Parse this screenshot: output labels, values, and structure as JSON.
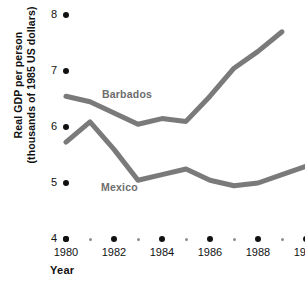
{
  "axes": {
    "ylabel": "Real GDP per person\n(thousands of 1985 US dollars)",
    "xlabel": "Year",
    "ytick_labels": [
      "8",
      "7",
      "6",
      "5",
      "4"
    ],
    "xtick_labels": [
      "1980",
      "1982",
      "1984",
      "1986",
      "1988",
      "1990"
    ]
  },
  "series_labels": {
    "barbados": "Barbados",
    "mexico": "Mexico"
  },
  "colors": {
    "line": "#7a7a7a",
    "tick": "#111111",
    "minor_tick": "#8d8d8d",
    "text": "#101010",
    "series_label": "#6d6d6d"
  },
  "chart_data": {
    "type": "line",
    "title": "",
    "xlabel": "Year",
    "ylabel": "Real GDP per person (thousands of 1985 US dollars)",
    "xlim": [
      1980,
      1990
    ],
    "ylim": [
      4,
      8
    ],
    "yticks": [
      4,
      5,
      6,
      7,
      8
    ],
    "xticks": [
      1980,
      1982,
      1984,
      1986,
      1988,
      1990
    ],
    "xminor_ticks": [
      1981,
      1983,
      1985,
      1987,
      1989
    ],
    "grid": false,
    "legend": "inline-labels",
    "x": [
      1980,
      1981,
      1982,
      1983,
      1984,
      1985,
      1986,
      1987,
      1988,
      1989
    ],
    "series": [
      {
        "name": "Barbados",
        "x": [
          1980,
          1981,
          1982,
          1983,
          1984,
          1985,
          1986,
          1987,
          1988,
          1989
        ],
        "values": [
          6.55,
          6.45,
          6.25,
          6.05,
          6.15,
          6.1,
          6.55,
          7.05,
          7.35,
          7.7
        ]
      },
      {
        "name": "Mexico",
        "x": [
          1980,
          1981,
          1982,
          1983,
          1984,
          1985,
          1986,
          1987,
          1988,
          1989,
          1990
        ],
        "values": [
          5.73,
          6.09,
          5.6,
          5.05,
          5.15,
          5.25,
          5.05,
          4.95,
          5.0,
          5.15,
          5.3
        ]
      }
    ]
  }
}
